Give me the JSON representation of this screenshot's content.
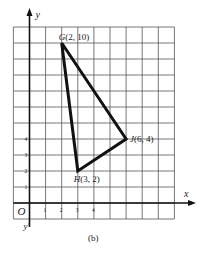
{
  "figure": {
    "caption": "(b)",
    "axes": {
      "x_label": "x",
      "y_label": "y",
      "y_neg_label": "y'",
      "origin_label": "O",
      "x_ticks": [
        "1",
        "2",
        "3",
        "4"
      ],
      "y_ticks": [
        "1",
        "2",
        "3",
        "4"
      ]
    },
    "grid": {
      "x_min": -1,
      "x_max": 9,
      "y_min": -1,
      "y_max": 11
    },
    "triangle": {
      "vertices": [
        {
          "name": "G",
          "label": "G(2, 10)",
          "x": 2,
          "y": 10
        },
        {
          "name": "J",
          "label": "J(6, 4)",
          "x": 6,
          "y": 4
        },
        {
          "name": "H",
          "label": "H(3, 2)",
          "x": 3,
          "y": 2
        }
      ]
    }
  }
}
